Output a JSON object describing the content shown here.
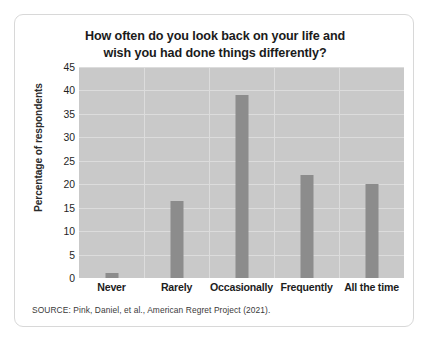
{
  "chart_data": {
    "type": "bar",
    "title": "How often do you look back on your life and wish you had done things differently?",
    "title_line1": "How often do you look back on your life and",
    "title_line2": "wish you had done things differently?",
    "xlabel": "",
    "ylabel": "Percentage of respondents",
    "categories": [
      "Never",
      "Rarely",
      "Occasionally",
      "Frequently",
      "All the time"
    ],
    "values": [
      1,
      16.5,
      39,
      22,
      20
    ],
    "ylim": [
      0,
      45
    ],
    "ytick_values": [
      0,
      5,
      10,
      15,
      20,
      25,
      30,
      35,
      40,
      45
    ],
    "ytick_labels": [
      "0",
      "5",
      "10",
      "15",
      "20",
      "25",
      "30",
      "35",
      "40",
      "45"
    ],
    "grid": true,
    "legend": "none",
    "bar_color": "#8c8c8c",
    "plot_background": "#c9c9c9",
    "gridline_color": "#dcdcdc"
  },
  "source": {
    "note": "SOURCE: Pink, Daniel, et al., American Regret Project (2021)."
  }
}
